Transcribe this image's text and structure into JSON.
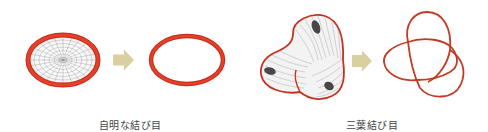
{
  "colors": {
    "knot_red": "#d8321e",
    "knot_dark_red": "#b1281a",
    "arrow": "#d9cf9f",
    "mesh": "#555555",
    "label": "#444444",
    "background": "#ffffff"
  },
  "panels": [
    {
      "id": "unknot",
      "label": "自明な結び目",
      "label_x": 130,
      "before": "unknot-with-seifert-surface",
      "after": "unknot-circle"
    },
    {
      "id": "trefoil",
      "label": "三葉結び目",
      "label_x": 372,
      "before": "trefoil-with-seifert-surface",
      "after": "trefoil-knot"
    }
  ]
}
